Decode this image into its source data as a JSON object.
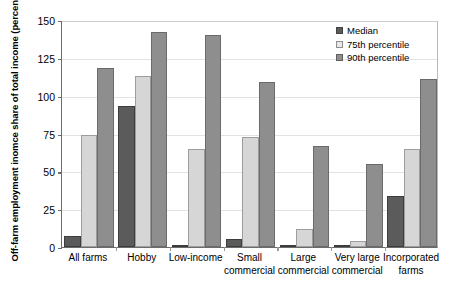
{
  "chart_data": {
    "type": "bar",
    "title": "",
    "xlabel": "",
    "ylabel": "Off-farm employment inomce share of total income (percent)",
    "ylim": [
      0,
      150
    ],
    "yticks": [
      0,
      25,
      50,
      75,
      100,
      125,
      150
    ],
    "ytick_labels": [
      "0",
      "25",
      "50",
      "75",
      "100",
      "125",
      "150"
    ],
    "grid": true,
    "legend_position": "top-right",
    "categories": [
      "All farms",
      "Hobby",
      "Low-income",
      "Small\ncommercial",
      "Large\ncommercial",
      "Very large\ncommercial",
      "Incorporated\nfarms"
    ],
    "series": [
      {
        "name": "Median",
        "color": "#5b5b5b",
        "values": [
          7,
          93,
          1,
          5,
          0,
          0,
          34
        ]
      },
      {
        "name": "75th percentile",
        "color": "#d6d6d6",
        "values": [
          74,
          113,
          65,
          73,
          12,
          4,
          65
        ]
      },
      {
        "name": "90th percentile",
        "color": "#8e8e8e",
        "values": [
          118,
          142,
          140,
          109,
          67,
          55,
          111
        ]
      }
    ]
  }
}
